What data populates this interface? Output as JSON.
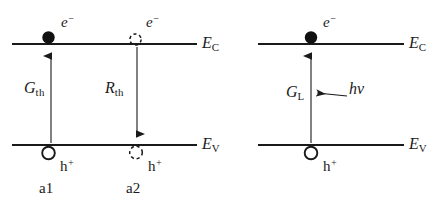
{
  "figure": {
    "type": "band-diagram",
    "colors": {
      "stroke": "#1a1a1a",
      "background": "#ffffff",
      "filled_carrier": "#111111"
    }
  },
  "panels": [
    {
      "id": "left",
      "bands": {
        "conduction": {
          "label_base": "E",
          "label_sub": "C"
        },
        "valence": {
          "label_base": "E",
          "label_sub": "V"
        }
      },
      "processes": [
        {
          "id": "a1",
          "caption": "a1",
          "rate_base": "G",
          "rate_sub": "th",
          "arrow_direction": "up",
          "electron": {
            "label_base": "e",
            "label_sup": "−",
            "state": "filled"
          },
          "hole": {
            "label_base": "h",
            "label_sup": "+",
            "state": "open"
          }
        },
        {
          "id": "a2",
          "caption": "a2",
          "rate_base": "R",
          "rate_sub": "th",
          "arrow_direction": "down",
          "electron": {
            "label_base": "e",
            "label_sup": "−",
            "state": "dashed"
          },
          "hole": {
            "label_base": "h",
            "label_sup": "+",
            "state": "dashed"
          }
        }
      ]
    },
    {
      "id": "right",
      "bands": {
        "conduction": {
          "label_base": "E",
          "label_sub": "C"
        },
        "valence": {
          "label_base": "E",
          "label_sub": "V"
        }
      },
      "processes": [
        {
          "id": "b1",
          "caption": "",
          "rate_base": "G",
          "rate_sub": "L",
          "arrow_direction": "up",
          "electron": {
            "label_base": "e",
            "label_sup": "−",
            "state": "filled"
          },
          "hole": {
            "label_base": "h",
            "label_sup": "+",
            "state": "open"
          },
          "photon": {
            "label_base": "h",
            "label_greek": "ν",
            "arrow_direction": "left"
          }
        }
      ]
    }
  ]
}
